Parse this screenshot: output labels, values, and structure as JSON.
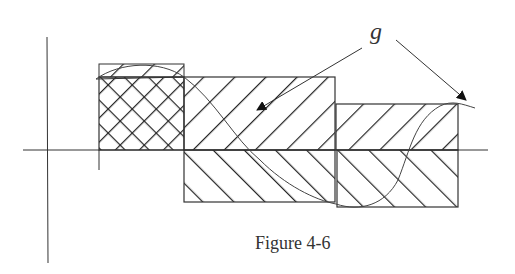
{
  "figure": {
    "caption": "Figure 4-6",
    "function_label": "g",
    "colors": {
      "stroke": "#222222",
      "curve": "#444444",
      "background": "#ffffff"
    }
  },
  "regions": [
    {
      "name": "interval-1",
      "pattern": "crosshatch",
      "side": "above-axis"
    },
    {
      "name": "interval-2-positive",
      "pattern": "forward-hatch",
      "side": "above-axis"
    },
    {
      "name": "interval-2-negative",
      "pattern": "back-hatch",
      "side": "below-axis"
    },
    {
      "name": "interval-3-positive",
      "pattern": "forward-hatch",
      "side": "above-axis"
    },
    {
      "name": "interval-3-negative",
      "pattern": "back-hatch",
      "side": "below-axis"
    }
  ],
  "arrows": [
    {
      "from": "label-g",
      "to": "curve-in-interval-2"
    },
    {
      "from": "label-g",
      "to": "curve-end-right"
    }
  ]
}
